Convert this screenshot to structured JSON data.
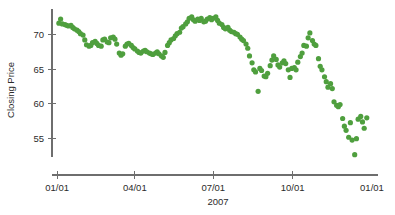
{
  "chart_data": {
    "type": "scatter",
    "title": "",
    "subtitle": "",
    "xlabel": "2007",
    "ylabel": "Closing Price",
    "xtick_labels": [
      "01/01",
      "04/01",
      "07/01",
      "10/01",
      "01/01"
    ],
    "xtick_values": [
      0,
      90,
      181,
      273,
      365
    ],
    "ytick_labels": [
      "55",
      "60",
      "65",
      "70"
    ],
    "ytick_values": [
      55,
      60,
      65,
      70
    ],
    "xlim": [
      -6,
      372
    ],
    "ylim": [
      51.5,
      73.5
    ],
    "grid": false,
    "legend": null,
    "marker_color": "#4f9f3e",
    "marker_size": 2.6,
    "series_name": "Closing Price",
    "x": [
      2,
      4,
      6,
      9,
      11,
      13,
      16,
      18,
      20,
      23,
      25,
      27,
      30,
      32,
      34,
      37,
      39,
      41,
      44,
      46,
      48,
      51,
      53,
      55,
      58,
      60,
      62,
      65,
      67,
      69,
      72,
      74,
      76,
      79,
      81,
      83,
      86,
      88,
      90,
      93,
      95,
      97,
      100,
      102,
      104,
      107,
      109,
      111,
      114,
      116,
      118,
      121,
      123,
      125,
      128,
      130,
      132,
      135,
      137,
      139,
      142,
      144,
      146,
      149,
      151,
      153,
      156,
      158,
      160,
      163,
      165,
      167,
      170,
      172,
      174,
      177,
      179,
      181,
      184,
      186,
      188,
      191,
      193,
      195,
      198,
      200,
      202,
      205,
      207,
      209,
      212,
      214,
      216,
      219,
      221,
      223,
      226,
      228,
      230,
      233,
      235,
      237,
      240,
      242,
      244,
      247,
      249,
      251,
      254,
      256,
      258,
      261,
      263,
      265,
      268,
      270,
      272,
      275,
      277,
      279,
      282,
      284,
      286,
      289,
      291,
      293,
      296,
      298,
      300,
      303,
      305,
      307,
      310,
      312,
      314,
      317,
      319,
      321,
      324,
      326,
      328,
      331,
      333,
      335,
      338,
      340,
      342,
      345,
      347,
      349,
      352,
      354,
      356,
      359
    ],
    "y": [
      71.6,
      72.2,
      71.5,
      71.4,
      71.3,
      71.2,
      71.3,
      71.0,
      70.8,
      70.6,
      70.4,
      70.1,
      69.9,
      69.2,
      68.5,
      68.3,
      68.4,
      68.8,
      69.0,
      68.7,
      68.4,
      68.3,
      69.2,
      69.3,
      68.9,
      68.8,
      69.5,
      69.6,
      69.3,
      68.6,
      67.3,
      67.0,
      67.2,
      68.3,
      68.6,
      68.7,
      68.4,
      68.1,
      67.9,
      67.6,
      67.4,
      67.3,
      67.6,
      67.7,
      67.5,
      67.3,
      67.2,
      67.1,
      67.3,
      67.5,
      67.2,
      66.9,
      66.7,
      67.4,
      68.4,
      68.8,
      69.2,
      69.4,
      69.8,
      70.1,
      70.3,
      70.9,
      71.1,
      71.5,
      71.8,
      72.3,
      72.5,
      72.1,
      71.9,
      72.2,
      72.0,
      72.3,
      71.8,
      71.9,
      72.2,
      72.4,
      72.1,
      72.3,
      72.5,
      72.0,
      71.6,
      71.4,
      71.0,
      70.8,
      71.0,
      70.6,
      70.4,
      70.3,
      70.1,
      70.0,
      69.6,
      69.3,
      69.1,
      68.6,
      68.0,
      66.9,
      65.9,
      64.9,
      64.6,
      61.8,
      65.1,
      64.8,
      64.0,
      63.9,
      64.4,
      65.5,
      66.3,
      66.9,
      66.4,
      65.6,
      65.3,
      65.9,
      66.2,
      65.8,
      64.9,
      63.8,
      65.1,
      65.2,
      64.9,
      66.0,
      66.8,
      67.3,
      68.4,
      68.3,
      69.5,
      70.2,
      69.1,
      68.6,
      68.4,
      66.5,
      65.4,
      64.9,
      63.9,
      63.2,
      62.4,
      62.9,
      62.2,
      60.3,
      59.8,
      59.6,
      59.9,
      57.9,
      56.8,
      56.2,
      55.2,
      57.3,
      54.8,
      52.7,
      55.0,
      57.8,
      58.2,
      57.4,
      56.5,
      58.0,
      61.6,
      61.5,
      58.9,
      59.5,
      58.4,
      59.8,
      58.3,
      58.5
    ],
    "yaxis": {
      "line_top_value": 73.6,
      "line_bottom_value": 52.4
    }
  },
  "figure": {
    "background_color": "#ffffff",
    "axis_color": "#6e6e6e",
    "text_color": "#2b2b2b"
  }
}
